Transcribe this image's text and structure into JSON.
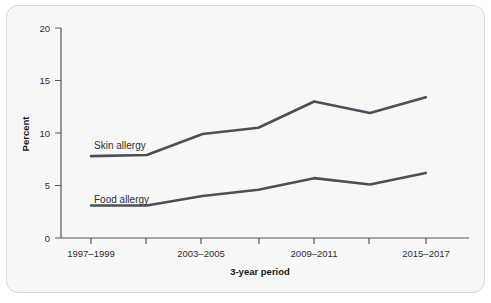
{
  "chart_data": {
    "type": "line",
    "title": "",
    "xlabel": "3-year period",
    "ylabel": "Percent",
    "ylim": [
      0,
      20
    ],
    "yticks": [
      0,
      5,
      10,
      15,
      20
    ],
    "ytick_labels": [
      "0",
      "5",
      "10",
      "15",
      "20"
    ],
    "grid": false,
    "legend_position": "inline-labels",
    "categories": [
      "1997–1999",
      "2000–2002",
      "2003–2005",
      "2006–2008",
      "2009–2011",
      "2012–2014",
      "2015–2017"
    ],
    "xtick_labels": [
      "1997–1999",
      "",
      "2003–2005",
      "",
      "2009–2011",
      "",
      "2015–2017"
    ],
    "visible_xtick_labels": [
      "1997–1999",
      "2003–2005",
      "2009–2011",
      "2015–2017"
    ],
    "series": [
      {
        "name": "Skin allergy",
        "label": "Skin allergy",
        "color": "#4c5056",
        "values": [
          7.8,
          7.9,
          9.9,
          10.5,
          13.0,
          11.9,
          13.4
        ]
      },
      {
        "name": "Food allergy",
        "label": "Food allergy",
        "color": "#4c5056",
        "values": [
          3.1,
          3.1,
          4.0,
          4.6,
          5.7,
          5.1,
          6.2
        ]
      }
    ]
  },
  "style": {
    "card_background": "#f7f7f7",
    "card_border": "#d8d8d8",
    "axis_color": "#55585c",
    "text_color": "#2d2f31",
    "line_color": "#4c5056"
  }
}
